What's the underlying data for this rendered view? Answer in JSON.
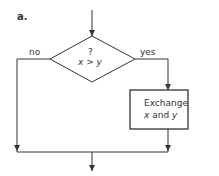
{
  "figure": {
    "panel_label": "a.",
    "decision": {
      "question_mark": "?",
      "condition": "x > y"
    },
    "branches": {
      "no": "no",
      "yes": "yes"
    },
    "process": {
      "line1": "Exchange",
      "line2_var1": "x",
      "line2_and": " and ",
      "line2_var2": "y"
    }
  },
  "colors": {
    "stroke": "#333333",
    "background": "#ffffff"
  }
}
